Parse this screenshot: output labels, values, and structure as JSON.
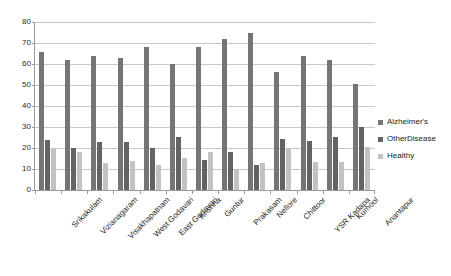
{
  "chart_data": {
    "type": "bar",
    "title": "",
    "subtitle": "",
    "xlabel": "",
    "ylabel": "",
    "ylim": [
      0,
      80
    ],
    "ytick_step": 10,
    "yticks": [
      0,
      10,
      20,
      30,
      40,
      50,
      60,
      70,
      80
    ],
    "grid": true,
    "legend_position": "right",
    "categories": [
      "Srikakulam",
      "Vizianagaram",
      "Visakhapatnam",
      "West Godavari",
      "East Godavari",
      "Krishna",
      "Guntur",
      "Prakasam",
      "Nellore",
      "Chittoor",
      "YSR Kadapa",
      "Kurnool",
      "Anantapur"
    ],
    "series": [
      {
        "name": "Alzheimer's",
        "color": "#757575",
        "values": [
          65.5,
          61.7,
          63.6,
          63.0,
          68.0,
          60.2,
          68.2,
          72.0,
          75.0,
          56.0,
          63.8,
          62.0,
          50.4
        ]
      },
      {
        "name": "OtherDisease",
        "color": "#636363",
        "values": [
          24.0,
          20.0,
          23.0,
          23.0,
          20.2,
          25.2,
          14.2,
          18.2,
          12.0,
          24.4,
          23.2,
          25.4,
          30.2
        ]
      },
      {
        "name": "Healthy",
        "color": "#c2c2c2",
        "values": [
          20.0,
          18.0,
          13.0,
          14.0,
          11.8,
          15.2,
          18.0,
          10.2,
          13.0,
          20.2,
          13.2,
          13.2,
          20.4
        ]
      }
    ]
  }
}
